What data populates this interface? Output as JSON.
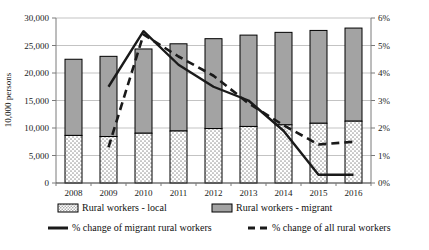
{
  "chart_data": {
    "type": "bar",
    "title": "",
    "subtitle": "",
    "categories": [
      "2008",
      "2009",
      "2010",
      "2011",
      "2012",
      "2013",
      "2014",
      "2015",
      "2016"
    ],
    "xlabel": "",
    "ylabel": "10,000 persons",
    "ylabel_right": "",
    "ylim": [
      0,
      30000
    ],
    "ylim_right": [
      0,
      0.06
    ],
    "y_ticks": [
      "0",
      "5,000",
      "10,000",
      "15,000",
      "20,000",
      "25,000",
      "30,000"
    ],
    "y_tick_values": [
      0,
      5000,
      10000,
      15000,
      20000,
      25000,
      30000
    ],
    "y_ticks_right": [
      "0%",
      "1%",
      "2%",
      "3%",
      "4%",
      "5%",
      "6%"
    ],
    "y_tick_values_right": [
      0,
      0.01,
      0.02,
      0.03,
      0.04,
      0.05,
      0.06
    ],
    "grid": true,
    "legend_position": "bottom",
    "stacked": true,
    "series": [
      {
        "name": "Rural workers - local",
        "axis": "left",
        "kind": "bar",
        "values": [
          8650,
          8450,
          9050,
          9450,
          9900,
          10280,
          10570,
          10860,
          11240
        ]
      },
      {
        "name": "Rural workers - migrant",
        "axis": "left",
        "kind": "bar",
        "values": [
          13850,
          14580,
          15320,
          15860,
          16340,
          16610,
          16820,
          16880,
          16930
        ]
      },
      {
        "name": "% change of migrant rural workers",
        "axis": "right",
        "kind": "line",
        "style": "solid",
        "values": [
          null,
          0.035,
          0.0552,
          0.043,
          0.035,
          0.03,
          0.019,
          0.003,
          0.003
        ]
      },
      {
        "name": "% change of all rural workers",
        "axis": "right",
        "kind": "line",
        "style": "dashed",
        "values": [
          null,
          0.013,
          0.054,
          0.046,
          0.039,
          0.029,
          0.021,
          0.014,
          0.015
        ]
      }
    ],
    "totals": [
      22500,
      23030,
      24370,
      25310,
      26240,
      26890,
      27390,
      27740,
      28170
    ]
  },
  "legend": {
    "items": [
      {
        "label": "Rural workers - local",
        "swatch": "pattern-dotted",
        "name": "legend-rural-local"
      },
      {
        "label": "Rural workers - migrant",
        "swatch": "fill-gray",
        "name": "legend-rural-migrant"
      },
      {
        "label": "% change of migrant rural workers",
        "swatch": "line-solid",
        "name": "legend-pct-migrant"
      },
      {
        "label": "% change of all rural workers",
        "swatch": "line-dashed",
        "name": "legend-pct-all"
      }
    ]
  },
  "colors": {
    "bar_migrant": "#a3a3a3",
    "bar_local_base": "#ffffff",
    "bar_local_dots": "#9c9c9c",
    "bar_border": "#000000",
    "line": "#1a1a1a",
    "grid": "#a9a9a9",
    "axis": "#7a7a7a",
    "text": "#1a1a1a"
  }
}
